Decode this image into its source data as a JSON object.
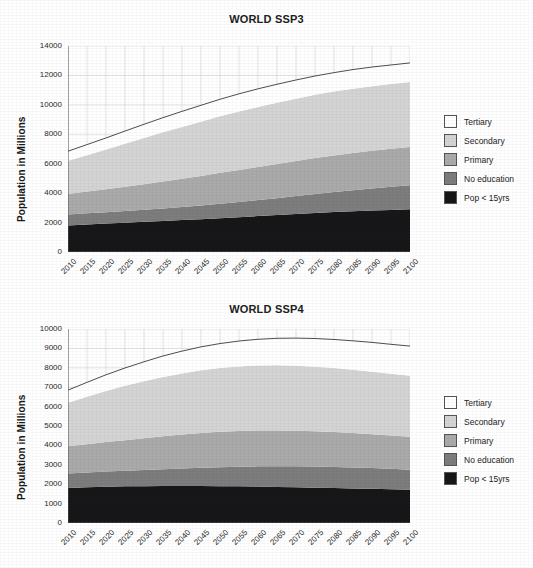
{
  "figure": {
    "ylabel": "Population in Millions"
  },
  "legend": {
    "items": [
      {
        "label": "Tertiary",
        "color": "#ffffff"
      },
      {
        "label": "Secondary",
        "color": "#d4d4d4"
      },
      {
        "label": "Primary",
        "color": "#aaaaaa"
      },
      {
        "label": "No education",
        "color": "#7d7d7d"
      },
      {
        "label": "Pop < 15yrs",
        "color": "#17171a"
      }
    ]
  },
  "chart_data": [
    {
      "type": "area",
      "title": "WORLD SSP3",
      "xlabel": "",
      "ylabel": "Population in Millions",
      "stacked": true,
      "grid": true,
      "legend_position": "right",
      "xlim": [
        2010,
        2100
      ],
      "ylim": [
        0,
        14000
      ],
      "ytick_step": 2000,
      "yticks": [
        0,
        2000,
        4000,
        6000,
        8000,
        10000,
        12000,
        14000
      ],
      "x": [
        2010,
        2015,
        2020,
        2025,
        2030,
        2035,
        2040,
        2045,
        2050,
        2055,
        2060,
        2065,
        2070,
        2075,
        2080,
        2085,
        2090,
        2095,
        2100
      ],
      "series": [
        {
          "name": "Pop < 15yrs",
          "values": [
            1800,
            1870,
            1930,
            1990,
            2050,
            2110,
            2170,
            2230,
            2300,
            2370,
            2440,
            2510,
            2580,
            2650,
            2710,
            2770,
            2820,
            2860,
            2900
          ]
        },
        {
          "name": "No education",
          "values": [
            750,
            760,
            770,
            790,
            820,
            850,
            890,
            930,
            980,
            1030,
            1090,
            1150,
            1220,
            1290,
            1360,
            1430,
            1500,
            1570,
            1640
          ]
        },
        {
          "name": "Primary",
          "values": [
            1400,
            1480,
            1560,
            1650,
            1740,
            1830,
            1920,
            2010,
            2100,
            2180,
            2250,
            2320,
            2380,
            2440,
            2490,
            2530,
            2560,
            2580,
            2600
          ]
        },
        {
          "name": "Secondary",
          "values": [
            2250,
            2470,
            2700,
            2930,
            3140,
            3340,
            3520,
            3690,
            3840,
            3970,
            4080,
            4170,
            4240,
            4300,
            4340,
            4370,
            4390,
            4400,
            4410
          ]
        },
        {
          "name": "Tertiary",
          "values": [
            650,
            720,
            790,
            860,
            930,
            1000,
            1060,
            1110,
            1160,
            1200,
            1230,
            1250,
            1270,
            1280,
            1290,
            1300,
            1300,
            1300,
            1300
          ]
        }
      ],
      "totals": [
        6850,
        7300,
        7750,
        8220,
        8680,
        9130,
        9560,
        9970,
        10380,
        10750,
        11090,
        11400,
        11690,
        11960,
        12190,
        12400,
        12570,
        12710,
        12850
      ]
    },
    {
      "type": "area",
      "title": "WORLD SSP4",
      "xlabel": "",
      "ylabel": "Population in Millions",
      "stacked": true,
      "grid": true,
      "legend_position": "right",
      "xlim": [
        2010,
        2100
      ],
      "ylim": [
        0,
        10000
      ],
      "ytick_step": 1000,
      "yticks": [
        0,
        1000,
        2000,
        3000,
        4000,
        5000,
        6000,
        7000,
        8000,
        9000,
        10000
      ],
      "x": [
        2010,
        2015,
        2020,
        2025,
        2030,
        2035,
        2040,
        2045,
        2050,
        2055,
        2060,
        2065,
        2070,
        2075,
        2080,
        2085,
        2090,
        2095,
        2100
      ],
      "series": [
        {
          "name": "Pop < 15yrs",
          "values": [
            1800,
            1840,
            1870,
            1890,
            1900,
            1910,
            1910,
            1910,
            1900,
            1890,
            1880,
            1860,
            1840,
            1820,
            1800,
            1780,
            1760,
            1740,
            1720
          ]
        },
        {
          "name": "No education",
          "values": [
            750,
            760,
            780,
            800,
            830,
            860,
            900,
            940,
            980,
            1010,
            1040,
            1060,
            1080,
            1090,
            1090,
            1080,
            1070,
            1050,
            1030
          ]
        },
        {
          "name": "Primary",
          "values": [
            1400,
            1460,
            1520,
            1580,
            1640,
            1700,
            1750,
            1790,
            1820,
            1840,
            1850,
            1850,
            1840,
            1820,
            1800,
            1780,
            1750,
            1720,
            1700
          ]
        },
        {
          "name": "Secondary",
          "values": [
            2250,
            2450,
            2640,
            2800,
            2940,
            3060,
            3150,
            3230,
            3290,
            3330,
            3350,
            3360,
            3350,
            3330,
            3300,
            3260,
            3220,
            3180,
            3140
          ]
        },
        {
          "name": "Tertiary",
          "values": [
            650,
            740,
            830,
            920,
            1000,
            1080,
            1150,
            1210,
            1260,
            1310,
            1350,
            1390,
            1420,
            1450,
            1470,
            1490,
            1510,
            1520,
            1530
          ]
        }
      ],
      "totals": [
        6850,
        7250,
        7640,
        7990,
        8310,
        8610,
        8860,
        9080,
        9250,
        9380,
        9470,
        9520,
        9530,
        9510,
        9460,
        9390,
        9310,
        9210,
        9120
      ]
    }
  ]
}
